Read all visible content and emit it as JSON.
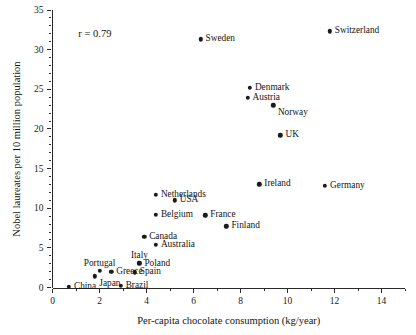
{
  "chart_data": {
    "type": "scatter",
    "title": "",
    "xlabel": "Per-capita chocolate consumption (kg/year)",
    "ylabel": "Nobel laureates per 10 million population",
    "xlim": [
      0,
      15
    ],
    "ylim": [
      0,
      35
    ],
    "xticks": [
      0,
      2,
      4,
      6,
      8,
      10,
      12,
      14
    ],
    "xticklabels": [
      "0",
      "2",
      "4",
      "6",
      "8",
      "10",
      "12",
      "14"
    ],
    "yticks": [
      0,
      5,
      10,
      15,
      20,
      25,
      30,
      35
    ],
    "yticklabels": [
      "0",
      "5",
      "10",
      "15",
      "20",
      "25",
      "30",
      "35"
    ],
    "xminor_step": 1,
    "yminor_step": 1,
    "grid": false,
    "legend": "none",
    "marker_color": "#1b1b1b",
    "axis_color": "#2a2a2a",
    "annotations": [
      {
        "text": "r = 0.79",
        "x": 1.1,
        "y": 32.0
      }
    ],
    "points": [
      {
        "label": "Switzerland",
        "x": 11.8,
        "y": 32.3,
        "label_pos": "right"
      },
      {
        "label": "Sweden",
        "x": 6.3,
        "y": 31.3,
        "label_pos": "right"
      },
      {
        "label": "Denmark",
        "x": 8.4,
        "y": 25.2,
        "label_pos": "right"
      },
      {
        "label": "Austria",
        "x": 8.3,
        "y": 23.9,
        "label_pos": "right"
      },
      {
        "label": "Norway",
        "x": 9.4,
        "y": 23.0,
        "label_pos": "below-right"
      },
      {
        "label": "UK",
        "x": 9.7,
        "y": 19.2,
        "label_pos": "right"
      },
      {
        "label": "Ireland",
        "x": 8.8,
        "y": 13.0,
        "label_pos": "right"
      },
      {
        "label": "Germany",
        "x": 11.6,
        "y": 12.8,
        "label_pos": "right"
      },
      {
        "label": "Netherlands",
        "x": 4.4,
        "y": 11.7,
        "label_pos": "right"
      },
      {
        "label": "USA",
        "x": 5.2,
        "y": 11.0,
        "label_pos": "right"
      },
      {
        "label": "Belgium",
        "x": 4.4,
        "y": 9.2,
        "label_pos": "right"
      },
      {
        "label": "France",
        "x": 6.5,
        "y": 9.1,
        "label_pos": "right"
      },
      {
        "label": "Finland",
        "x": 7.4,
        "y": 7.7,
        "label_pos": "right"
      },
      {
        "label": "Canada",
        "x": 3.9,
        "y": 6.4,
        "label_pos": "right"
      },
      {
        "label": "Australia",
        "x": 4.4,
        "y": 5.4,
        "label_pos": "right"
      },
      {
        "label": "Italy",
        "x": 3.7,
        "y": 3.1,
        "label_pos": "above"
      },
      {
        "label": "Poland",
        "x": 3.7,
        "y": 3.0,
        "label_pos": "right"
      },
      {
        "label": "Portugal",
        "x": 2.0,
        "y": 2.1,
        "label_pos": "above"
      },
      {
        "label": "Greece",
        "x": 2.5,
        "y": 2.0,
        "label_pos": "right"
      },
      {
        "label": "Spain",
        "x": 3.5,
        "y": 1.9,
        "label_pos": "right"
      },
      {
        "label": "Japan",
        "x": 1.8,
        "y": 1.4,
        "label_pos": "below-right"
      },
      {
        "label": "Brazil",
        "x": 2.9,
        "y": 0.2,
        "label_pos": "right"
      },
      {
        "label": "China",
        "x": 0.7,
        "y": 0.1,
        "label_pos": "right"
      }
    ]
  }
}
